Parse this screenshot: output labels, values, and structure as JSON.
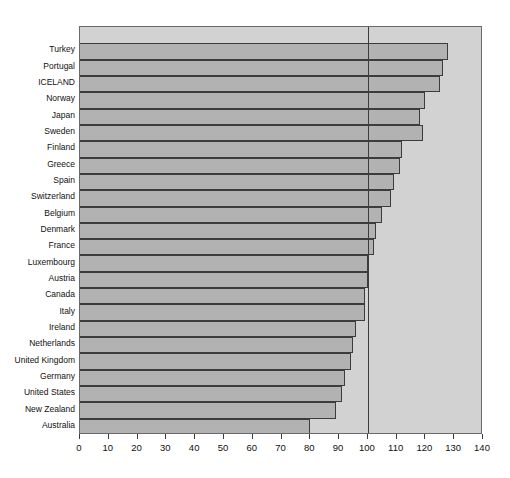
{
  "chart_data": {
    "type": "bar",
    "orientation": "horizontal",
    "title": "",
    "subtitle": "",
    "xlabel": "",
    "ylabel": "",
    "xlim": [
      0,
      140
    ],
    "xticks": [
      0,
      10,
      20,
      30,
      40,
      50,
      60,
      70,
      80,
      90,
      100,
      110,
      120,
      130,
      140
    ],
    "xticklabels": [
      "0",
      "10",
      "20",
      "30",
      "40",
      "50",
      "60",
      "70",
      "80",
      "90",
      "100",
      "110",
      "120",
      "130",
      "140"
    ],
    "grid": false,
    "legend": null,
    "reference_line": {
      "value": 100,
      "orientation": "vertical",
      "color": "#3c3c3c"
    },
    "categories": [
      "Turkey",
      "Portugal",
      "ICELAND",
      "Norway",
      "Japan",
      "Sweden",
      "Finland",
      "Greece",
      "Spain",
      "Switzerland",
      "Belgium",
      "Denmark",
      "France",
      "Luxembourg",
      "Austria",
      "Canada",
      "Italy",
      "Ireland",
      "Netherlands",
      "United Kingdom",
      "Germany",
      "United States",
      "New Zealand",
      "Australia"
    ],
    "values": [
      128,
      126,
      125,
      120,
      118,
      119,
      112,
      111,
      109,
      108,
      105,
      103,
      102,
      100,
      100,
      99,
      99,
      96,
      95,
      94,
      92,
      91,
      89,
      80
    ],
    "series": [
      {
        "name": "value",
        "values": [
          128,
          126,
          125,
          120,
          118,
          119,
          112,
          111,
          109,
          108,
          105,
          103,
          102,
          100,
          100,
          99,
          99,
          96,
          95,
          94,
          92,
          91,
          89,
          80
        ]
      }
    ]
  },
  "style": {
    "plot_background": "#d2d2d2",
    "bar_fill": "#b2b2b2",
    "bar_edge": "#3c3c3c",
    "axis_color": "#6a6a6a",
    "text_color": "#111111",
    "page_background": "#ffffff"
  }
}
